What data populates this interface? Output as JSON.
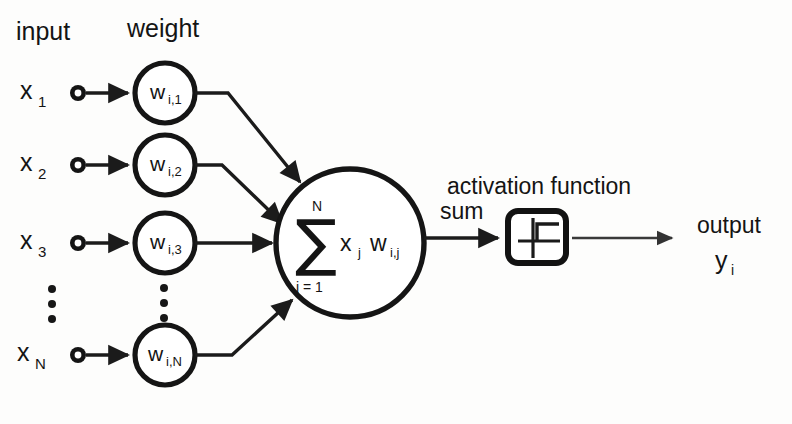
{
  "diagram": {
    "headers": {
      "input": "input",
      "weight": "weight"
    },
    "inputs": [
      {
        "base": "x",
        "sub": "1",
        "weight_base": "w",
        "weight_sub": "i,1"
      },
      {
        "base": "x",
        "sub": "2",
        "weight_base": "w",
        "weight_sub": "i,2"
      },
      {
        "base": "x",
        "sub": "3",
        "weight_base": "w",
        "weight_sub": "i,3"
      },
      {
        "base": "x",
        "sub": "N",
        "weight_base": "w",
        "weight_sub": "i,N"
      }
    ],
    "ellipsis": {
      "symbol": "vertical-dots",
      "count": 3
    },
    "summation": {
      "sigma": "∑",
      "upper_limit": "N",
      "lower_limit": "j = 1",
      "term_x": "x",
      "term_x_sub": "j",
      "term_w": "w",
      "term_w_sub": "i,j"
    },
    "sum_label": "sum",
    "activation": {
      "label": "activation function",
      "glyph": "step-function"
    },
    "output": {
      "label": "output",
      "var_base": "y",
      "var_sub": "i"
    },
    "colors": {
      "stroke": "#151515",
      "background": "#fdfdfc",
      "node_fill": "#ffffff"
    }
  }
}
